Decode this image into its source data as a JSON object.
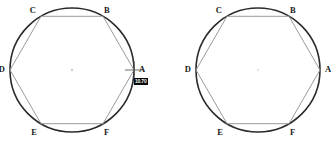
{
  "figure_left": {
    "name": "circle-with-inscribed-hexagon-left",
    "circle": {
      "cx": 72,
      "cy": 70,
      "r": 62,
      "stroke": "#2b2b2b",
      "stroke_width": 1.6
    },
    "hexagon": {
      "stroke": "#9a9a9a",
      "stroke_width": 1.0,
      "fill": "none"
    },
    "center_dot": {
      "cx": 72,
      "cy": 70,
      "r": 0.9,
      "color": "#b0b0b0",
      "visible": true
    },
    "vertices": [
      {
        "id": "A",
        "label": "A",
        "angle_deg": 0,
        "x": 134,
        "y": 70,
        "label_x": 139,
        "label_y": 70
      },
      {
        "id": "B",
        "label": "B",
        "angle_deg": 60,
        "x": 103,
        "y": 16.3,
        "label_x": 104,
        "label_y": 11
      },
      {
        "id": "C",
        "label": "C",
        "angle_deg": 120,
        "x": 41,
        "y": 16.3,
        "label_x": 36,
        "label_y": 11
      },
      {
        "id": "D",
        "label": "D",
        "angle_deg": 180,
        "x": 10,
        "y": 70,
        "label_x": 5,
        "label_y": 70
      },
      {
        "id": "E",
        "label": "E",
        "angle_deg": 240,
        "x": 41,
        "y": 123.7,
        "label_x": 37,
        "label_y": 133
      },
      {
        "id": "F",
        "label": "F",
        "angle_deg": 300,
        "x": 103,
        "y": 123.7,
        "label_x": 104,
        "label_y": 133
      }
    ],
    "cursor": {
      "type": "crosshair",
      "x": 134,
      "y": 70,
      "arm": 9,
      "color": "#4a4a4a",
      "visible": true
    },
    "tooltip": {
      "text": "10.70",
      "x": 134,
      "y": 78,
      "visible": true
    }
  },
  "figure_right": {
    "name": "circle-with-inscribed-hexagon-right",
    "circle": {
      "cx": 90,
      "cy": 70,
      "r": 62,
      "stroke": "#2b2b2b",
      "stroke_width": 1.6
    },
    "hexagon": {
      "stroke": "#9a9a9a",
      "stroke_width": 1.0,
      "fill": "none"
    },
    "center_dot": {
      "cx": 90,
      "cy": 70,
      "r": 0.9,
      "color": "#d8d8d8",
      "visible": true
    },
    "vertices": [
      {
        "id": "A",
        "label": "A",
        "angle_deg": 0,
        "x": 152,
        "y": 70,
        "label_x": 157,
        "label_y": 70
      },
      {
        "id": "B",
        "label": "B",
        "angle_deg": 60,
        "x": 121,
        "y": 16.3,
        "label_x": 122,
        "label_y": 11
      },
      {
        "id": "C",
        "label": "C",
        "angle_deg": 120,
        "x": 59,
        "y": 16.3,
        "label_x": 54,
        "label_y": 11
      },
      {
        "id": "D",
        "label": "D",
        "angle_deg": 180,
        "x": 28,
        "y": 70,
        "label_x": 23,
        "label_y": 70
      },
      {
        "id": "E",
        "label": "E",
        "angle_deg": 240,
        "x": 59,
        "y": 123.7,
        "label_x": 55,
        "label_y": 133
      },
      {
        "id": "F",
        "label": "F",
        "angle_deg": 300,
        "x": 121,
        "y": 123.7,
        "label_x": 122,
        "label_y": 133
      }
    ],
    "cursor": {
      "type": "none",
      "visible": false
    },
    "tooltip": {
      "text": "",
      "visible": false
    }
  },
  "canvas": {
    "width": 336,
    "height": 144,
    "background": "#ffffff"
  }
}
